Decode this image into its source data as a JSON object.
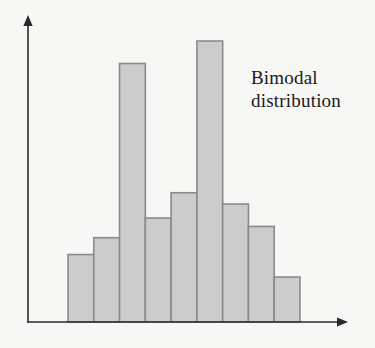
{
  "chart_data": {
    "type": "bar",
    "title": "",
    "subtitle": "",
    "xlabel": "",
    "ylabel": "",
    "categories": [
      "1",
      "2",
      "3",
      "4",
      "5",
      "6",
      "7",
      "8",
      "9"
    ],
    "values": [
      24,
      30,
      92,
      37,
      46,
      100,
      42,
      34,
      16
    ],
    "ylim": [
      0,
      109
    ],
    "xlim": [
      0,
      9
    ],
    "grid": false,
    "legend": null,
    "legend_position": "none",
    "axis_tick_labels": {
      "x": [],
      "y": []
    },
    "annotations": [
      {
        "name": "bimodal-distribution-label",
        "text": "Bimodal\ndistribution",
        "line_1": "Bimodal",
        "line_2": "distribution"
      }
    ],
    "series": [
      {
        "name": "frequency",
        "values": [
          24,
          30,
          92,
          37,
          46,
          100,
          42,
          34,
          16
        ]
      }
    ],
    "style": {
      "bar_fill": "#cccccc",
      "bar_border": "#8a8a8a",
      "axis_color": "#2a2a2a",
      "background": "#f7f7f5",
      "text_color": "#1a1a1a"
    },
    "axes": {
      "y_axis_arrow": true,
      "x_axis_arrow": true,
      "y_axis_x": 28,
      "x_axis_y": 322,
      "y_axis_top": 15,
      "x_axis_right": 348
    },
    "bar_geometry": {
      "left": 68,
      "right": 300,
      "baseline": 322,
      "max_top": 41,
      "count": 9
    }
  }
}
